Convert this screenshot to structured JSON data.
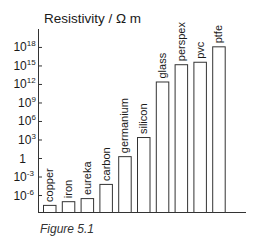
{
  "chart_data": {
    "type": "bar",
    "title": "Resistivity / Ω m",
    "xlabel": "",
    "ylabel": "Resistivity / Ω m",
    "yscale": "log",
    "ylim_exponent": [
      -9,
      19
    ],
    "y_ticks": [
      {
        "exp": 18,
        "label": "10",
        "sup": "18"
      },
      {
        "exp": 15,
        "label": "10",
        "sup": "15"
      },
      {
        "exp": 12,
        "label": "10",
        "sup": "12"
      },
      {
        "exp": 9,
        "label": "10",
        "sup": "9"
      },
      {
        "exp": 6,
        "label": "10",
        "sup": "6"
      },
      {
        "exp": 3,
        "label": "10",
        "sup": "3"
      },
      {
        "exp": 0,
        "label": "1",
        "sup": ""
      },
      {
        "exp": -3,
        "label": "10",
        "sup": "-3"
      },
      {
        "exp": -6,
        "label": "10",
        "sup": "-6"
      }
    ],
    "categories": [
      "copper",
      "iron",
      "eureka",
      "carbon",
      "germanium",
      "silicon",
      "glass",
      "perspex",
      "pvc",
      "ptfe"
    ],
    "values_exponent": [
      -7.6,
      -7.0,
      -6.5,
      -4.2,
      0.3,
      3.4,
      12.4,
      15.2,
      15.6,
      18.1
    ],
    "values": [
      2.5e-08,
      1e-07,
      3e-07,
      6e-05,
      2,
      2500,
      2500000000000.0,
      1600000000000000.0,
      4000000000000000.0,
      1.3e+18
    ],
    "grid": false,
    "legend": null
  },
  "caption": "Figure 5.1"
}
